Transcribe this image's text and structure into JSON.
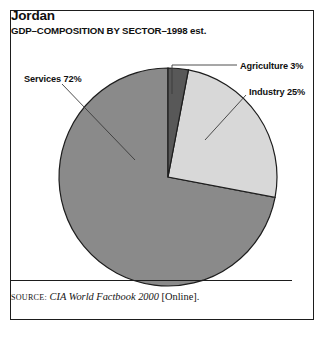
{
  "figure": {
    "title": "Jordan",
    "subtitle": "GDP–COMPOSITION BY SECTOR–1998 est."
  },
  "labels": {
    "services": "Services 72%",
    "agriculture": "Agriculture 3%",
    "industry": "Industry 25%"
  },
  "source": {
    "label": "Source:",
    "title": "CIA World Factbook 2000",
    "suffix": "[Online]."
  },
  "colors": {
    "agriculture": "#585858",
    "industry": "#d8d8d8",
    "services": "#8a8a8a",
    "outline": "#1d1d1d",
    "frame": "#1d1d1d",
    "text": "#101010",
    "background": "#ffffff"
  },
  "chart_data": {
    "type": "pie",
    "title": "Jordan",
    "subtitle": "GDP–COMPOSITION BY SECTOR–1998 est.",
    "categories": [
      "Agriculture",
      "Industry",
      "Services"
    ],
    "values": [
      3,
      25,
      72
    ],
    "units": "percent",
    "labels": [
      "Agriculture 3%",
      "Industry 25%",
      "Services 72%"
    ],
    "colors": [
      "#585858",
      "#d8d8d8",
      "#8a8a8a"
    ],
    "start_angle_deg": 0,
    "direction": "clockwise",
    "legend": "callout-labels",
    "center": [
      168,
      177
    ],
    "radius": 109,
    "source": "CIA World Factbook 2000 [Online]."
  }
}
